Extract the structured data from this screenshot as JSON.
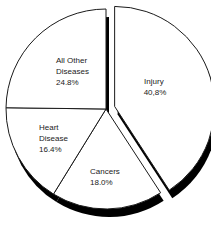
{
  "chart_data": {
    "type": "pie",
    "title": "",
    "categories": [
      "Injury",
      "Cancers",
      "Heart Disease",
      "All Other Diseases"
    ],
    "values": [
      40.8,
      18.0,
      16.4,
      24.8
    ],
    "value_labels": [
      "40,8%",
      "18.0%",
      "16.4%",
      "24.8%"
    ],
    "exploded": [
      "Injury"
    ],
    "start_angle_deg": 0,
    "direction": "clockwise",
    "style": "3d-shadow",
    "colors": {
      "fill": "#ffffff",
      "stroke": "#1a1a1a",
      "shadow": "#000000"
    },
    "legend": "none"
  },
  "slices": [
    {
      "name_lines": [
        "Injury"
      ],
      "value": "40,8%"
    },
    {
      "name_lines": [
        "Cancers"
      ],
      "value": "18.0%"
    },
    {
      "name_lines": [
        "Heart",
        "Disease"
      ],
      "value": "16.4%"
    },
    {
      "name_lines": [
        "All Other",
        "Diseases"
      ],
      "value": "24.8%"
    }
  ]
}
